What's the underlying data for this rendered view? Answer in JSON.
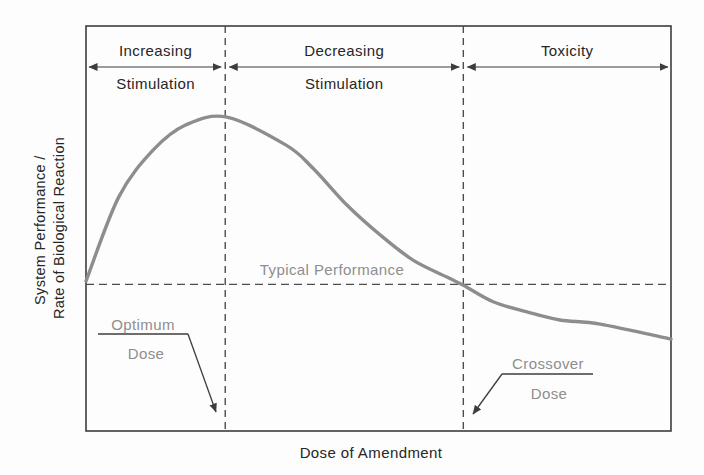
{
  "colors": {
    "background": "#fdfdfd",
    "axis": "#3d3d3d",
    "dashed_line": "#4d4d4d",
    "curve": "#8d8d8d",
    "text_dark": "#262626",
    "text_gray": "#8e8e8e"
  },
  "chart_data": {
    "type": "line",
    "title": "",
    "xlabel": "Dose of Amendment",
    "ylabel_line1": "System Performance /",
    "ylabel_line2": "Rate of Biological Reaction",
    "axes_note": "conceptual unitless axes, no tick labels, grid off",
    "regions": [
      {
        "label_line1": "Increasing",
        "label_line2": "Stimulation",
        "x_start_frac": 0.0,
        "x_end_frac": 0.238
      },
      {
        "label_line1": "Decreasing",
        "label_line2": "Stimulation",
        "x_start_frac": 0.238,
        "x_end_frac": 0.645
      },
      {
        "label_line1": "Toxicity",
        "label_line2": "",
        "x_start_frac": 0.645,
        "x_end_frac": 1.0
      }
    ],
    "markers": {
      "optimum_dose_x_frac": 0.238,
      "crossover_dose_x_frac": 0.645,
      "typical_performance_y_frac": 0.362
    },
    "annotations": {
      "typical_performance": "Typical Performance",
      "optimum_line1": "Optimum",
      "optimum_line2": "Dose",
      "crossover_line1": "Crossover",
      "crossover_line2": "Dose"
    },
    "series": [
      {
        "name": "system-performance-dose-response-curve",
        "points_frac": [
          [
            0.0,
            0.37
          ],
          [
            0.056,
            0.578
          ],
          [
            0.115,
            0.694
          ],
          [
            0.171,
            0.756
          ],
          [
            0.241,
            0.775
          ],
          [
            0.342,
            0.706
          ],
          [
            0.388,
            0.649
          ],
          [
            0.446,
            0.558
          ],
          [
            0.503,
            0.484
          ],
          [
            0.559,
            0.422
          ],
          [
            0.617,
            0.38
          ],
          [
            0.645,
            0.36
          ],
          [
            0.696,
            0.319
          ],
          [
            0.754,
            0.294
          ],
          [
            0.81,
            0.274
          ],
          [
            0.879,
            0.264
          ],
          [
            1.0,
            0.227
          ]
        ]
      }
    ]
  }
}
